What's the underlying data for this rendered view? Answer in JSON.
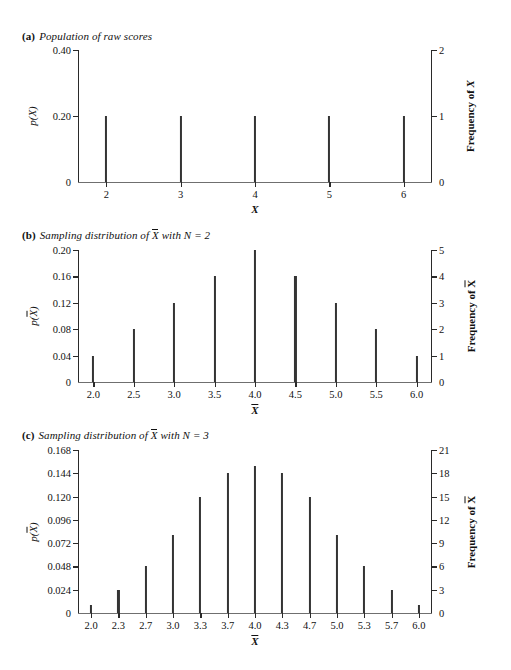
{
  "figure": {
    "panels": [
      {
        "tag": "(a)",
        "caption": "Population of raw scores",
        "caption_prefix": "Population of raw scores",
        "caption_suffix": "",
        "has_xbar_in_caption": false,
        "y_left_title": "p(X)",
        "y_right_title": "Frequency of X",
        "x_title": "X",
        "x_title_is_xbar": false
      },
      {
        "tag": "(b)",
        "caption": "Sampling distribution of X̄ with N = 2",
        "caption_prefix": "Sampling distribution of",
        "caption_suffix": "with N = 2",
        "has_xbar_in_caption": true,
        "y_left_title": "p(X̄)",
        "y_right_title": "Frequency of X̄",
        "x_title": "X̄",
        "x_title_is_xbar": true
      },
      {
        "tag": "(c)",
        "caption": "Sampling distribution of X̄ with N = 3",
        "caption_prefix": "Sampling distribution of",
        "caption_suffix": "with N = 3",
        "has_xbar_in_caption": true,
        "y_left_title": "p(X̄)",
        "y_right_title": "Frequency of X̄",
        "x_title": "X̄",
        "x_title_is_xbar": true
      }
    ]
  },
  "chart_data": [
    {
      "type": "bar",
      "panel": "a",
      "title": "Population of raw scores",
      "xlabel": "X",
      "ylabel": "p(X)",
      "y2label": "Frequency of X",
      "grid": false,
      "legend": "none",
      "categories": [
        "2",
        "3",
        "4",
        "5",
        "6"
      ],
      "x": [
        2,
        3,
        4,
        5,
        6
      ],
      "values": [
        0.2,
        0.2,
        0.2,
        0.2,
        0.2
      ],
      "frequencies": [
        1,
        1,
        1,
        1,
        1
      ],
      "xlim": [
        1.62,
        6.38
      ],
      "ylim": [
        0,
        0.4
      ],
      "y2lim": [
        0,
        2
      ],
      "yticks": [
        0,
        0.2,
        0.4
      ],
      "ytick_labels": [
        "0",
        "0.20",
        "0.40"
      ],
      "y2ticks": [
        0,
        1,
        2
      ],
      "y2tick_labels": [
        "0",
        "1",
        "2"
      ],
      "xticks": [
        2,
        3,
        4,
        5,
        6
      ],
      "xtick_labels": [
        "2",
        "3",
        "4",
        "5",
        "6"
      ]
    },
    {
      "type": "bar",
      "panel": "b",
      "title": "Sampling distribution of X̄ with N = 2",
      "xlabel": "X̄",
      "ylabel": "p(X̄)",
      "y2label": "Frequency of X̄",
      "grid": false,
      "legend": "none",
      "categories": [
        "2.0",
        "2.5",
        "3.0",
        "3.5",
        "4.0",
        "4.5",
        "5.0",
        "5.5",
        "6.0"
      ],
      "x": [
        2.0,
        2.5,
        3.0,
        3.5,
        4.0,
        4.5,
        5.0,
        5.5,
        6.0
      ],
      "values": [
        0.04,
        0.08,
        0.12,
        0.16,
        0.2,
        0.16,
        0.12,
        0.08,
        0.04
      ],
      "frequencies": [
        1,
        2,
        3,
        4,
        5,
        4,
        3,
        2,
        1
      ],
      "xlim": [
        1.81,
        6.19
      ],
      "ylim": [
        0,
        0.2
      ],
      "y2lim": [
        0,
        5
      ],
      "yticks": [
        0,
        0.04,
        0.08,
        0.12,
        0.16,
        0.2
      ],
      "ytick_labels": [
        "0",
        "0.04",
        "0.08",
        "0.12",
        "0.16",
        "0.20"
      ],
      "y2ticks": [
        0,
        1,
        2,
        3,
        4,
        5
      ],
      "y2tick_labels": [
        "0",
        "1",
        "2",
        "3",
        "4",
        "5"
      ],
      "xticks": [
        2.0,
        2.5,
        3.0,
        3.5,
        4.0,
        4.5,
        5.0,
        5.5,
        6.0
      ],
      "xtick_labels": [
        "2.0",
        "2.5",
        "3.0",
        "3.5",
        "4.0",
        "4.5",
        "5.0",
        "5.5",
        "6.0"
      ]
    },
    {
      "type": "bar",
      "panel": "c",
      "title": "Sampling distribution of X̄ with N = 3",
      "xlabel": "X̄",
      "ylabel": "p(X̄)",
      "y2label": "Frequency of X̄",
      "grid": false,
      "legend": "none",
      "categories": [
        "2.0",
        "2.3",
        "2.7",
        "3.0",
        "3.3",
        "3.7",
        "4.0",
        "4.3",
        "4.7",
        "5.0",
        "5.3",
        "5.7",
        "6.0"
      ],
      "x": [
        2.0,
        2.3333,
        2.6667,
        3.0,
        3.3333,
        3.6667,
        4.0,
        4.3333,
        4.6667,
        5.0,
        5.3333,
        5.6667,
        6.0
      ],
      "values": [
        0.008,
        0.024,
        0.048,
        0.08,
        0.12,
        0.144,
        0.152,
        0.144,
        0.12,
        0.08,
        0.048,
        0.024,
        0.008
      ],
      "frequencies": [
        1,
        3,
        6,
        10,
        15,
        18,
        19,
        18,
        15,
        10,
        6,
        3,
        1
      ],
      "xlim": [
        1.84,
        6.16
      ],
      "ylim": [
        0,
        0.168
      ],
      "y2lim": [
        0,
        21
      ],
      "yticks": [
        0,
        0.024,
        0.048,
        0.072,
        0.096,
        0.12,
        0.144,
        0.168
      ],
      "ytick_labels": [
        "0",
        "0.024",
        "0.048",
        "0.072",
        "0.096",
        "0.120",
        "0.144",
        "0.168"
      ],
      "y2ticks": [
        0,
        3,
        6,
        9,
        12,
        15,
        18,
        21
      ],
      "y2tick_labels": [
        "0",
        "3",
        "6",
        "9",
        "12",
        "15",
        "18",
        "21"
      ],
      "xticks": [
        2.0,
        2.3333,
        2.6667,
        3.0,
        3.3333,
        3.6667,
        4.0,
        4.3333,
        4.6667,
        5.0,
        5.3333,
        5.6667,
        6.0
      ],
      "xtick_labels": [
        "2.0",
        "2.3",
        "2.7",
        "3.0",
        "3.3",
        "3.7",
        "4.0",
        "4.3",
        "4.7",
        "5.0",
        "5.3",
        "5.7",
        "6.0"
      ]
    }
  ]
}
